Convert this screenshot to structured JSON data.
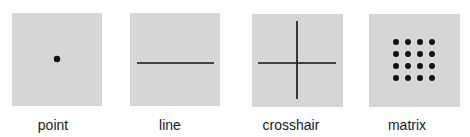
{
  "colors": {
    "panel_bg": "#d6d6d6",
    "mark": "#111111",
    "page_bg": "#ffffff"
  },
  "panels": [
    {
      "id": "point",
      "label": "point",
      "icon": "point-icon"
    },
    {
      "id": "line",
      "label": "line",
      "icon": "line-icon"
    },
    {
      "id": "crosshair",
      "label": "crosshair",
      "icon": "crosshair-icon"
    },
    {
      "id": "matrix",
      "label": "matrix",
      "icon": "matrix-icon",
      "grid": "4x4"
    }
  ]
}
